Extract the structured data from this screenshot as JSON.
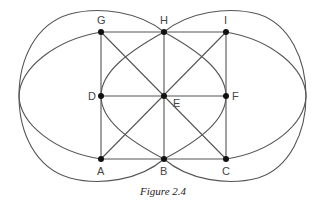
{
  "figure": {
    "caption": "Figure 2.4",
    "colors": {
      "stroke": "#555555",
      "point": "#111111",
      "label": "#444444"
    },
    "points": [
      {
        "id": "G",
        "label": "G",
        "x": 101,
        "y": 32
      },
      {
        "id": "H",
        "label": "H",
        "x": 164,
        "y": 32
      },
      {
        "id": "I",
        "label": "I",
        "x": 226,
        "y": 32
      },
      {
        "id": "D",
        "label": "D",
        "x": 101,
        "y": 96
      },
      {
        "id": "E",
        "label": "E",
        "x": 164,
        "y": 96
      },
      {
        "id": "F",
        "label": "F",
        "x": 226,
        "y": 96
      },
      {
        "id": "A",
        "label": "A",
        "x": 101,
        "y": 159
      },
      {
        "id": "B",
        "label": "B",
        "x": 164,
        "y": 159
      },
      {
        "id": "C",
        "label": "C",
        "x": 226,
        "y": 159
      }
    ],
    "straight_edges": [
      [
        "G",
        "H"
      ],
      [
        "H",
        "I"
      ],
      [
        "D",
        "E"
      ],
      [
        "E",
        "F"
      ],
      [
        "A",
        "B"
      ],
      [
        "B",
        "C"
      ],
      [
        "G",
        "D"
      ],
      [
        "D",
        "A"
      ],
      [
        "H",
        "E"
      ],
      [
        "E",
        "B"
      ],
      [
        "I",
        "F"
      ],
      [
        "F",
        "C"
      ],
      [
        "G",
        "E"
      ],
      [
        "E",
        "C"
      ],
      [
        "A",
        "E"
      ],
      [
        "E",
        "I"
      ]
    ],
    "curves": [
      "outer-left oval through H, left extreme, B, F",
      "outer-right oval through H, right extreme, B, D",
      "inner-left arc G to A",
      "inner-right arc I to C"
    ]
  }
}
